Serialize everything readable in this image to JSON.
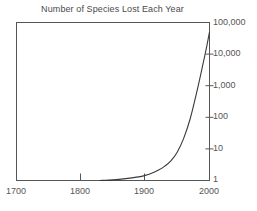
{
  "chart_data": {
    "type": "line",
    "title": "Number of Species Lost Each Year",
    "xlabel": "",
    "ylabel": "",
    "grid": false,
    "legend": null,
    "yscale": "log",
    "xlim": [
      1700,
      2000
    ],
    "ylim": [
      1,
      100000
    ],
    "y_ticks": [
      1,
      10,
      100,
      1000,
      10000,
      100000
    ],
    "y_tick_labels": [
      "1",
      "10",
      "100",
      "1,000",
      "10,000",
      "100,000"
    ],
    "y_axis_position": "right",
    "x_ticks": [
      1700,
      1800,
      1900,
      2000
    ],
    "x_tick_labels": [
      "1700",
      "1800",
      "1900",
      "2000"
    ],
    "series": [
      {
        "name": "Species lost per year",
        "x": [
          1830,
          1850,
          1870,
          1890,
          1900,
          1910,
          1920,
          1930,
          1940,
          1950,
          1960,
          1970,
          1980,
          1990,
          1995,
          2000
        ],
        "values": [
          1.0,
          1.05,
          1.15,
          1.3,
          1.45,
          1.7,
          2.1,
          2.8,
          4.2,
          8,
          22,
          90,
          600,
          5000,
          15000,
          50000
        ]
      }
    ],
    "line_color": "#3a3a3a",
    "background_color": "#ffffff",
    "frame_color": "#555555"
  },
  "axis": {
    "y_labels": [
      "100,000",
      "10,000",
      "1,000",
      "100",
      "10",
      "1"
    ],
    "x_labels": [
      "1700",
      "1800",
      "1900",
      "2000"
    ]
  }
}
